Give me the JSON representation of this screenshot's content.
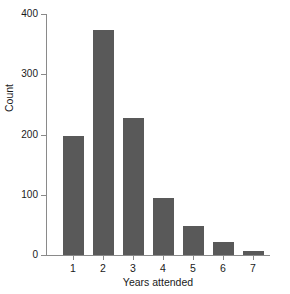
{
  "chart_data": {
    "type": "bar",
    "title": "",
    "xlabel": "Years attended",
    "ylabel": "Count",
    "categories": [
      "1",
      "2",
      "3",
      "4",
      "5",
      "6",
      "7"
    ],
    "values": [
      197,
      373,
      227,
      95,
      48,
      22,
      7
    ],
    "series": [
      {
        "name": "Count",
        "values": [
          197,
          373,
          227,
          95,
          48,
          22,
          7
        ]
      }
    ],
    "xlim": [
      0.4,
      7.9
    ],
    "ylim": [
      0,
      400
    ],
    "yticks": [
      0,
      100,
      200,
      300,
      400
    ],
    "ytick_labels": [
      "0",
      "100",
      "200",
      "300",
      "400"
    ],
    "xticks": [
      1,
      2,
      3,
      4,
      5,
      6,
      7
    ],
    "xtick_labels": [
      "1",
      "2",
      "3",
      "4",
      "5",
      "6",
      "7"
    ],
    "grid": false,
    "legend": false,
    "legend_position": "none",
    "bar_color": "#595959",
    "axis_color": "#8a8a8a",
    "background_color": "#ffffff",
    "annotations": []
  }
}
